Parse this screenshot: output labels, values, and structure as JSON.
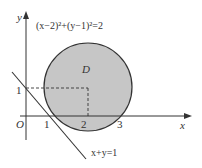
{
  "diagram": {
    "circle_equation": "(x−2)²+(y−1)²=2",
    "region_label": "D",
    "line_equation": "x+y=1",
    "axis_x_label": "x",
    "axis_y_label": "y",
    "origin_label": "O",
    "x_ticks": [
      "1",
      "2",
      "3"
    ],
    "y_ticks": [
      "1"
    ],
    "circle": {
      "center": [
        2,
        1
      ],
      "radius_squared": 2
    },
    "colors": {
      "fill": "#c8c8c8",
      "stroke": "#333333"
    }
  }
}
